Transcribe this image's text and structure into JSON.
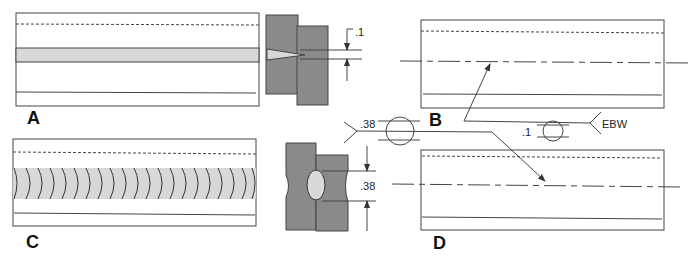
{
  "figure": {
    "panels": [
      {
        "id": "A",
        "label": "A",
        "description": "Plan view of joint with shaded weld band (partial penetration)"
      },
      {
        "id": "B",
        "label": "B",
        "description": "Plan view with centerline, arrow-side EBW symbol"
      },
      {
        "id": "C",
        "label": "C",
        "description": "Plan view with weld bead ripples"
      },
      {
        "id": "D",
        "label": "D",
        "description": "Plan view with centerline, other-side weld symbol"
      }
    ],
    "section_A": {
      "dimension": ".1"
    },
    "section_C": {
      "dimension": ".38"
    },
    "weld_symbol_upper": {
      "size": ".38"
    },
    "weld_symbol_lower": {
      "size": ".1",
      "process": "EBW"
    },
    "colors": {
      "plate": "#8a8a8a",
      "weld_band": "#d8d8d8",
      "line": "#444444"
    }
  }
}
